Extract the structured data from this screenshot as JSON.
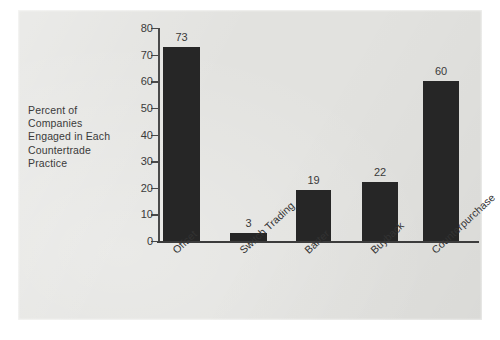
{
  "chart_data": {
    "type": "bar",
    "title": "",
    "subtitle": "",
    "xlabel": "",
    "ylabel": "Percent of Companies Engaged in Each Countertrade Practice",
    "ylabel_lines": [
      "Percent of",
      "Companies",
      "Engaged in Each",
      "Countertrade",
      "Practice"
    ],
    "categories": [
      "Offset",
      "Switch Trading",
      "Barter",
      "Buyback",
      "Counterpurchase"
    ],
    "values": [
      73,
      3,
      19,
      22,
      60
    ],
    "value_labels": [
      "73",
      "3",
      "19",
      "22",
      "60"
    ],
    "ylim": [
      0,
      80
    ],
    "ytick_values": [
      0,
      10,
      20,
      30,
      40,
      50,
      60,
      70,
      80
    ],
    "ytick_labels": [
      "0",
      "10",
      "20",
      "30",
      "40",
      "50",
      "60",
      "70",
      "80"
    ],
    "grid": false,
    "legend": null,
    "legend_position": "none",
    "bar_color": "#262626",
    "panel_color": "#e2e2df",
    "axis_color": "#4a4a4a",
    "text_color": "#3a3a3a",
    "xtick_label_rotation": -43
  }
}
